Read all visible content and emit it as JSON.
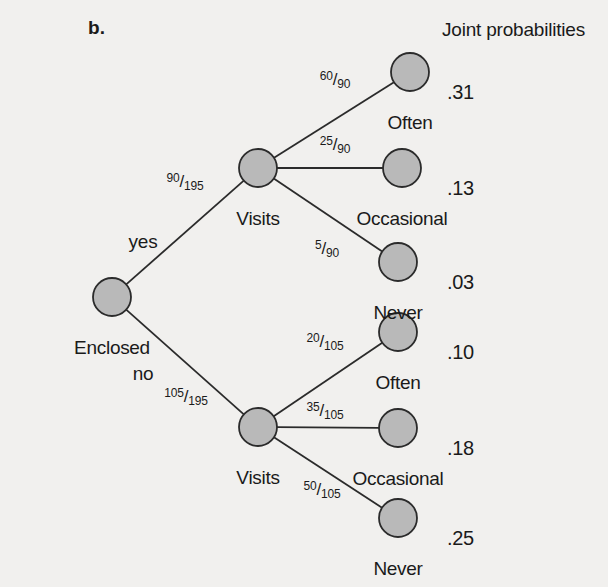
{
  "figure": {
    "panel_letter": "b.",
    "header": "Joint probabilities",
    "background_color": "#f1f0ee",
    "node_fill_color": "#b9b9b9",
    "node_stroke_color": "#2b2b2b",
    "edge_color": "#2b2b2b"
  },
  "chart_data": {
    "type": "diagram",
    "diagram_type": "probability-tree",
    "title": "b.",
    "header": "Joint probabilities",
    "root": {
      "id": "root",
      "label": "Enclosed",
      "cx": 112,
      "cy": 297
    },
    "nodes": [
      {
        "id": "root",
        "label": "Enclosed",
        "cx": 112,
        "cy": 297,
        "label_dx": 0,
        "label_dy": 41
      },
      {
        "id": "visits-yes",
        "label": "Visits",
        "cx": 258,
        "cy": 168,
        "label_dx": 0,
        "label_dy": 41
      },
      {
        "id": "visits-no",
        "label": "Visits",
        "cx": 258,
        "cy": 427,
        "label_dx": 0,
        "label_dy": 41
      },
      {
        "id": "yes-often",
        "label": "Often",
        "cx": 410,
        "cy": 72,
        "label_dx": 0,
        "label_dy": 41
      },
      {
        "id": "yes-occasional",
        "label": "Occasional",
        "cx": 402,
        "cy": 168,
        "label_dx": 0,
        "label_dy": 41
      },
      {
        "id": "yes-never",
        "label": "Never",
        "cx": 398,
        "cy": 262,
        "label_dx": 0,
        "label_dy": 41
      },
      {
        "id": "no-often",
        "label": "Often",
        "cx": 398,
        "cy": 332,
        "label_dx": 0,
        "label_dy": 41
      },
      {
        "id": "no-occasional",
        "label": "Occasional",
        "cx": 398,
        "cy": 428,
        "label_dx": 0,
        "label_dy": 41
      },
      {
        "id": "no-never",
        "label": "Never",
        "cx": 398,
        "cy": 518,
        "label_dx": 0,
        "label_dy": 41
      }
    ],
    "node_radius": 19,
    "edges": [
      {
        "from": "root",
        "to": "visits-yes",
        "word": "yes",
        "word_x": 143,
        "word_y": 232,
        "numerator": "90",
        "denominator": "195",
        "frac_x": 185,
        "frac_y": 182
      },
      {
        "from": "root",
        "to": "visits-no",
        "word": "no",
        "word_x": 143,
        "word_y": 364,
        "numerator": "105",
        "denominator": "195",
        "frac_x": 186,
        "frac_y": 397
      },
      {
        "from": "visits-yes",
        "to": "yes-often",
        "word": "",
        "word_x": 0,
        "word_y": 0,
        "numerator": "60",
        "denominator": "90",
        "frac_x": 335,
        "frac_y": 80
      },
      {
        "from": "visits-yes",
        "to": "yes-occasional",
        "word": "",
        "word_x": 0,
        "word_y": 0,
        "numerator": "25",
        "denominator": "90",
        "frac_x": 335,
        "frac_y": 145
      },
      {
        "from": "visits-yes",
        "to": "yes-never",
        "word": "",
        "word_x": 0,
        "word_y": 0,
        "numerator": "5",
        "denominator": "90",
        "frac_x": 327,
        "frac_y": 249
      },
      {
        "from": "visits-no",
        "to": "no-often",
        "word": "",
        "word_x": 0,
        "word_y": 0,
        "numerator": "20",
        "denominator": "105",
        "frac_x": 325,
        "frac_y": 342
      },
      {
        "from": "visits-no",
        "to": "no-occasional",
        "word": "",
        "word_x": 0,
        "word_y": 0,
        "numerator": "35",
        "denominator": "105",
        "frac_x": 325,
        "frac_y": 411
      },
      {
        "from": "visits-no",
        "to": "no-never",
        "word": "",
        "word_x": 0,
        "word_y": 0,
        "numerator": "50",
        "denominator": "105",
        "frac_x": 322,
        "frac_y": 490
      }
    ],
    "joint_probabilities": [
      {
        "node": "yes-often",
        "value": ".31",
        "x": 447,
        "y": 82
      },
      {
        "node": "yes-occasional",
        "value": ".13",
        "x": 447,
        "y": 178
      },
      {
        "node": "yes-never",
        "value": ".03",
        "x": 447,
        "y": 272
      },
      {
        "node": "no-often",
        "value": ".10",
        "x": 447,
        "y": 342
      },
      {
        "node": "no-occasional",
        "value": ".18",
        "x": 447,
        "y": 438
      },
      {
        "node": "no-never",
        "value": ".25",
        "x": 447,
        "y": 528
      }
    ],
    "branch_conditional_probabilities": [
      {
        "path": "Enclosed=yes",
        "fraction": "90/195"
      },
      {
        "path": "Enclosed=no",
        "fraction": "105/195"
      },
      {
        "path": "yes -> Visits Often",
        "fraction": "60/90"
      },
      {
        "path": "yes -> Visits Occasional",
        "fraction": "25/90"
      },
      {
        "path": "yes -> Visits Never",
        "fraction": "5/90"
      },
      {
        "path": "no -> Visits Often",
        "fraction": "20/105"
      },
      {
        "path": "no -> Visits Occasional",
        "fraction": "35/105"
      },
      {
        "path": "no -> Visits Never",
        "fraction": "50/105"
      }
    ]
  }
}
